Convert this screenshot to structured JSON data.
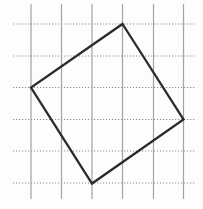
{
  "diagram": {
    "canvas": {
      "width": 203,
      "height": 209,
      "background": "#fdfdfd"
    },
    "grid": {
      "vertical_lines": {
        "xs": [
          31,
          61.5,
          92,
          122.5,
          153.5,
          183.5
        ],
        "y1": 4,
        "y2": 199,
        "style": "solid",
        "color": "#a2a2a2",
        "stroke_width": 1.2
      },
      "horizontal_lines": {
        "ys": [
          24,
          56,
          87.5,
          119.5,
          151,
          183
        ],
        "x1": 13,
        "x2": 196,
        "style": "dotted",
        "dash": "1.2 1.8",
        "color": "#8d8d8d",
        "stroke_width": 1.2
      }
    },
    "square": {
      "vertices": [
        [
          122.5,
          24
        ],
        [
          183.5,
          119.5
        ],
        [
          92,
          183.5
        ],
        [
          31,
          87.5
        ]
      ],
      "color": "#2b2b2b",
      "stroke_width": 2.3,
      "fill": "none"
    }
  }
}
